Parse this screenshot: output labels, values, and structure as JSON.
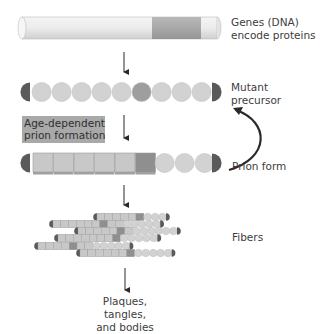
{
  "figure": {
    "stages": [
      {
        "id": "dna",
        "label_lines": [
          "Genes (DNA)",
          "encode proteins"
        ]
      },
      {
        "id": "mutant-precursor",
        "label_lines": [
          "Mutant",
          "precursor"
        ]
      },
      {
        "id": "prion-form",
        "label_lines": [
          "Prion form"
        ]
      },
      {
        "id": "fibers",
        "label_lines": [
          "Fibers"
        ]
      },
      {
        "id": "outcome",
        "label_lines": [
          "Plaques, tangles,",
          "and bodies"
        ]
      }
    ],
    "process_label_lines": [
      "Age-dependent",
      "prion formation"
    ],
    "dna_rod": {
      "highlight_segment": "mutated gene region"
    },
    "precursor_chain": {
      "beads": 9,
      "mutant_bead_index": 5
    },
    "prion_chain": {
      "cubes": 6,
      "mutant_cube_index": 5,
      "remaining_beads": 3
    },
    "colors": {
      "bead": "#d2d2d2",
      "bead_mutant": "#9e9e9e",
      "cap": "#5a5a5a",
      "cube": "#c8c8c8",
      "cube_mutant": "#8f8f8f",
      "process_box": "#a9a9a9",
      "arrow": "#2a2a2a"
    }
  }
}
